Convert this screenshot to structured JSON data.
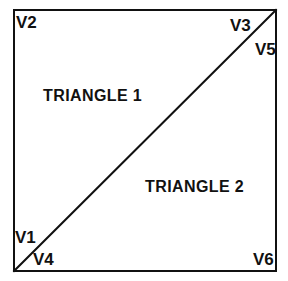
{
  "diagram": {
    "background_color": "#ffffff",
    "stroke_color": "#111111",
    "box": {
      "border_width_px": 2,
      "x": 13,
      "y": 9,
      "width": 264,
      "height": 263
    },
    "diagonal": {
      "name": "split-diagonal",
      "from": "bottom-left",
      "to": "top-right",
      "x1": 14,
      "y1": 271,
      "x2": 276,
      "y2": 10,
      "stroke_width_px": 2
    },
    "vertex_labels": [
      {
        "id": "v2",
        "text": "V2",
        "corner": "top-left"
      },
      {
        "id": "v3",
        "text": "V3",
        "corner": "top-right"
      },
      {
        "id": "v5",
        "text": "V5",
        "corner": "top-right"
      },
      {
        "id": "v1",
        "text": "V1",
        "corner": "bottom-left"
      },
      {
        "id": "v4",
        "text": "V4",
        "corner": "bottom-left"
      },
      {
        "id": "v6",
        "text": "V6",
        "corner": "bottom-right"
      }
    ],
    "face_labels": [
      {
        "id": "triangle-1",
        "text": "TRIANGLE 1",
        "region": "upper-left"
      },
      {
        "id": "triangle-2",
        "text": "TRIANGLE 2",
        "region": "lower-right"
      }
    ]
  }
}
